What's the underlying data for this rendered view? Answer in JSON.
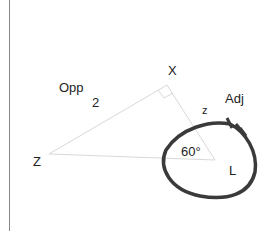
{
  "diagram": {
    "labels": {
      "opp": "Opp",
      "opp_value": "2",
      "vertex_x": "X",
      "vertex_z": "Z",
      "vertex_l": "L",
      "adj": "Adj",
      "side_z": "z",
      "angle": "60°"
    },
    "colors": {
      "triangle_stroke": "#d8d8d8",
      "loop_stroke": "#3a3a3a",
      "border_line": "#8a8a8a"
    },
    "points": {
      "Z": [
        49,
        154
      ],
      "X": [
        167,
        85
      ],
      "L": [
        215,
        160
      ]
    }
  }
}
